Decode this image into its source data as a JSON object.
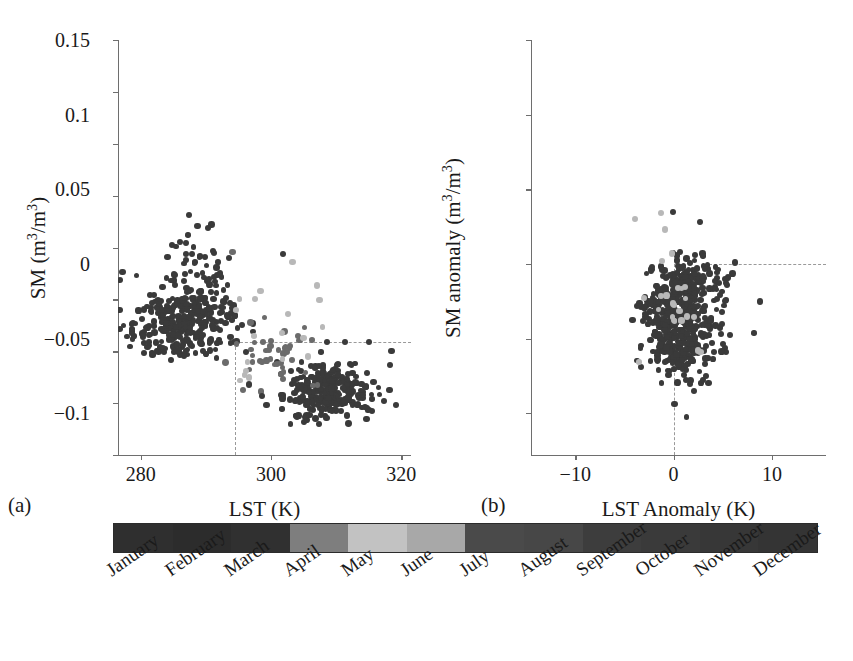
{
  "figure": {
    "background": "#ffffff",
    "dot_dark": "#3a3a3a",
    "dot_mid": "#6b6b6b",
    "dot_light": "#b8b8b8",
    "axis_color": "#6e6e6e",
    "dash_color": "#9a9a9a"
  },
  "panels": [
    {
      "tag": "(a)",
      "xlabel_html": "LST (K)",
      "ylabel_html": "SM (m<sup>3</sup>/m<sup>3</sup>)",
      "xticks": [
        "280",
        "300",
        "320"
      ],
      "xtick_values": [
        280,
        300,
        320
      ],
      "yticks": [
        "0",
        "0.05",
        "0.1",
        "0.15",
        "0.2",
        "0.25",
        "0.3",
        "0.35",
        "0.4"
      ],
      "ytick_values": [
        0,
        0.05,
        0.1,
        0.15,
        0.2,
        0.25,
        0.3,
        0.35,
        0.4
      ],
      "xlim": [
        276.5,
        321.5
      ],
      "ylim": [
        0,
        0.4
      ],
      "ref_h": 0.109,
      "ref_v": 294.5
    },
    {
      "tag": "(b)",
      "xlabel_html": "LST Anomaly (K)",
      "ylabel_html": "SM anomaly (m<sup>3</sup>/m<sup>3</sup>)",
      "xticks": [
        "−10",
        "0",
        "10"
      ],
      "xtick_values": [
        -10,
        0,
        10
      ],
      "yticks": [
        "−0.1",
        "−0.05",
        "0",
        "0.05",
        "0.1",
        "0.15"
      ],
      "ytick_values": [
        -0.1,
        -0.05,
        0,
        0.05,
        0.1,
        0.15
      ],
      "xlim": [
        -14.5,
        15.5
      ],
      "ylim": [
        -0.128,
        0.15
      ],
      "ref_h": 0.0,
      "ref_v": 0.0
    }
  ],
  "chart_data": [
    {
      "type": "scatter",
      "panel": "(a)",
      "title": "",
      "xlabel": "LST (K)",
      "ylabel": "SM (m3/m3)",
      "xlim": [
        276.5,
        321.5
      ],
      "ylim": [
        0,
        0.4
      ],
      "xticks": [
        280,
        300,
        320
      ],
      "yticks": [
        0,
        0.05,
        0.1,
        0.15,
        0.2,
        0.25,
        0.3,
        0.35,
        0.4
      ],
      "grid": false,
      "legend": "none",
      "colorbar": "month",
      "annotations": [
        {
          "kind": "dashed-hline",
          "y": 0.109,
          "from_x": 294.5,
          "to_x": 321.5
        },
        {
          "kind": "dashed-vline",
          "x": 294.5,
          "from_y": 0,
          "to_y": 0.109
        }
      ],
      "clusters": [
        {
          "name": "cold-wet-winter",
          "n": 300,
          "x_center": 286.5,
          "x_spread": 4.2,
          "y_center": 0.125,
          "y_spread": 0.017,
          "shade": "dark"
        },
        {
          "name": "cold-wet-highSM-tail",
          "n": 60,
          "x_center": 288.5,
          "x_spread": 2.2,
          "y_center": 0.168,
          "y_spread": 0.022,
          "shade": "dark"
        },
        {
          "name": "warm-dry-summer",
          "n": 280,
          "x_center": 308.5,
          "x_spread": 3.4,
          "y_center": 0.062,
          "y_spread": 0.013,
          "shade": "dark"
        },
        {
          "name": "transition-spring",
          "n": 45,
          "x_center": 300.5,
          "x_spread": 3.0,
          "y_center": 0.098,
          "y_spread": 0.016,
          "shade": "mid"
        },
        {
          "name": "light-month-outliers",
          "n": 14,
          "x_center": 301.0,
          "x_spread": 6.0,
          "y_center": 0.125,
          "y_spread": 0.03,
          "shade": "light"
        }
      ],
      "outliers": [
        {
          "x": 287.4,
          "y": 0.231,
          "shade": "dark"
        },
        {
          "x": 288.7,
          "y": 0.221,
          "shade": "dark"
        },
        {
          "x": 290.3,
          "y": 0.219,
          "shade": "dark"
        },
        {
          "x": 287.0,
          "y": 0.204,
          "shade": "dark"
        },
        {
          "x": 287.0,
          "y": 0.194,
          "shade": "dark"
        },
        {
          "x": 287.0,
          "y": 0.188,
          "shade": "dark"
        },
        {
          "x": 294.1,
          "y": 0.196,
          "shade": "mid"
        },
        {
          "x": 293.6,
          "y": 0.19,
          "shade": "dark"
        },
        {
          "x": 301.8,
          "y": 0.194,
          "shade": "dark"
        },
        {
          "x": 303.3,
          "y": 0.186,
          "shade": "light"
        },
        {
          "x": 292.2,
          "y": 0.175,
          "shade": "dark"
        },
        {
          "x": 298.4,
          "y": 0.158,
          "shade": "light"
        },
        {
          "x": 297.6,
          "y": 0.15,
          "shade": "light"
        },
        {
          "x": 294.6,
          "y": 0.14,
          "shade": "light"
        },
        {
          "x": 305.0,
          "y": 0.113,
          "shade": "light"
        },
        {
          "x": 318.5,
          "y": 0.1,
          "shade": "dark"
        },
        {
          "x": 318.3,
          "y": 0.087,
          "shade": "dark"
        },
        {
          "x": 319.2,
          "y": 0.048,
          "shade": "dark"
        },
        {
          "x": 296.6,
          "y": 0.068,
          "shade": "dark"
        },
        {
          "x": 298.6,
          "y": 0.057,
          "shade": "dark"
        },
        {
          "x": 296.2,
          "y": 0.099,
          "shade": "dark"
        },
        {
          "x": 315.0,
          "y": 0.109,
          "shade": "dark"
        },
        {
          "x": 311.4,
          "y": 0.109,
          "shade": "dark"
        },
        {
          "x": 308.6,
          "y": 0.109,
          "shade": "dark"
        }
      ]
    },
    {
      "type": "scatter",
      "panel": "(b)",
      "title": "",
      "xlabel": "LST Anomaly (K)",
      "ylabel": "SM anomaly (m3/m3)",
      "xlim": [
        -14.5,
        15.5
      ],
      "ylim": [
        -0.128,
        0.15
      ],
      "xticks": [
        -10,
        0,
        10
      ],
      "yticks": [
        -0.1,
        -0.05,
        0,
        0.05,
        0.1,
        0.15
      ],
      "grid": false,
      "legend": "none",
      "colorbar": "month",
      "annotations": [
        {
          "kind": "dashed-hline",
          "y": 0.0,
          "from_x": 3.6,
          "to_x": 15.5
        },
        {
          "kind": "dashed-vline",
          "x": 0.0,
          "from_y": -0.128,
          "to_y": 0.0
        }
      ],
      "clusters": [
        {
          "name": "main-anomaly-cloud",
          "n": 420,
          "x_center": 0.9,
          "x_spread": 1.7,
          "y_center": -0.042,
          "y_spread": 0.018,
          "shade": "dark"
        },
        {
          "name": "near-zero-band",
          "n": 110,
          "x_center": 1.3,
          "x_spread": 1.8,
          "y_center": -0.01,
          "y_spread": 0.008,
          "shade": "dark"
        },
        {
          "name": "left-lobe",
          "n": 60,
          "x_center": -1.3,
          "x_spread": 0.8,
          "y_center": -0.035,
          "y_spread": 0.013,
          "shade": "dark"
        },
        {
          "name": "light-month-points",
          "n": 22,
          "x_center": 1.0,
          "x_spread": 1.8,
          "y_center": -0.03,
          "y_spread": 0.018,
          "shade": "light"
        }
      ],
      "outliers": [
        {
          "x": -3.9,
          "y": 0.03,
          "shade": "light"
        },
        {
          "x": -1.3,
          "y": 0.034,
          "shade": "light"
        },
        {
          "x": -0.1,
          "y": 0.035,
          "shade": "dark"
        },
        {
          "x": -0.9,
          "y": 0.023,
          "shade": "light"
        },
        {
          "x": -0.2,
          "y": 0.007,
          "shade": "light"
        },
        {
          "x": 2.2,
          "y": 0.006,
          "shade": "dark"
        },
        {
          "x": 4.6,
          "y": -0.013,
          "shade": "dark"
        },
        {
          "x": 5.3,
          "y": -0.013,
          "shade": "dark"
        },
        {
          "x": 4.7,
          "y": -0.021,
          "shade": "dark"
        },
        {
          "x": 4.9,
          "y": -0.032,
          "shade": "dark"
        },
        {
          "x": 4.8,
          "y": -0.047,
          "shade": "dark"
        },
        {
          "x": 1.3,
          "y": -0.078,
          "shade": "dark"
        },
        {
          "x": 2.1,
          "y": -0.085,
          "shade": "dark"
        },
        {
          "x": 0.1,
          "y": -0.094,
          "shade": "dark"
        },
        {
          "x": 3.3,
          "y": -0.075,
          "shade": "dark"
        }
      ]
    }
  ],
  "colorbar": {
    "label": "month-colorbar",
    "months": [
      {
        "name": "January",
        "color": "#2f2f2f"
      },
      {
        "name": "February",
        "color": "#2c2c2c"
      },
      {
        "name": "March",
        "color": "#303030"
      },
      {
        "name": "April",
        "color": "#7e7e7e"
      },
      {
        "name": "May",
        "color": "#c2c2c2"
      },
      {
        "name": "June",
        "color": "#a8a8a8"
      },
      {
        "name": "July",
        "color": "#4a4a4a"
      },
      {
        "name": "August",
        "color": "#474747"
      },
      {
        "name": "September",
        "color": "#3d3d3d"
      },
      {
        "name": "October",
        "color": "#3a3a3a"
      },
      {
        "name": "November",
        "color": "#373737"
      },
      {
        "name": "December",
        "color": "#343434"
      }
    ]
  }
}
